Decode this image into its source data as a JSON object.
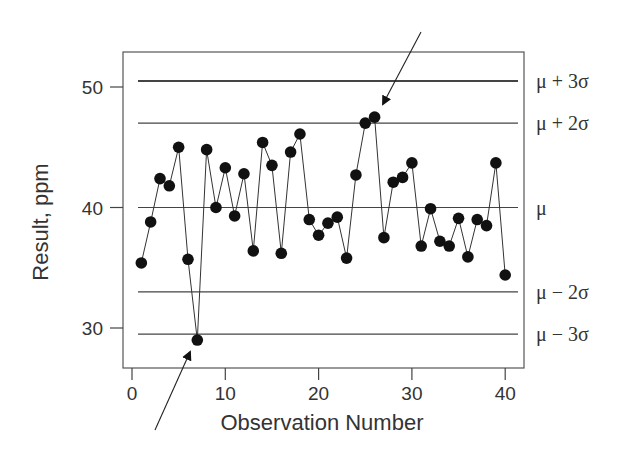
{
  "chart_data": {
    "type": "line",
    "title": "",
    "xlabel": "Observation Number",
    "ylabel": "Result, ppm",
    "xlim": [
      -1,
      42
    ],
    "ylim": [
      26.5,
      53
    ],
    "xticks": [
      0,
      10,
      20,
      30,
      40
    ],
    "yticks": [
      30,
      40,
      50
    ],
    "grid": false,
    "legend": null,
    "series": [
      {
        "name": "Result",
        "marker": "filled-circle",
        "x": [
          1,
          2,
          3,
          4,
          5,
          6,
          7,
          8,
          9,
          10,
          11,
          12,
          13,
          14,
          15,
          16,
          17,
          18,
          19,
          20,
          21,
          22,
          23,
          24,
          25,
          26,
          27,
          28,
          29,
          30,
          31,
          32,
          33,
          34,
          35,
          36,
          37,
          38,
          39,
          40
        ],
        "values": [
          35.4,
          38.8,
          42.4,
          41.8,
          45.0,
          35.7,
          29.0,
          44.8,
          40.0,
          43.3,
          39.3,
          42.8,
          36.4,
          45.4,
          43.5,
          36.2,
          44.6,
          46.1,
          39.0,
          37.7,
          38.7,
          39.2,
          35.8,
          42.7,
          47.0,
          47.5,
          37.5,
          42.1,
          42.5,
          43.7,
          36.8,
          39.9,
          37.2,
          36.8,
          39.1,
          35.9,
          39.0,
          38.5,
          43.7,
          34.4
        ]
      }
    ],
    "control_lines": [
      {
        "label": "μ + 3σ",
        "value": 50.5,
        "weight": "bold"
      },
      {
        "label": "μ + 2σ",
        "value": 47.0,
        "weight": "normal"
      },
      {
        "label": "μ",
        "value": 40.0,
        "weight": "normal"
      },
      {
        "label": "μ − 2σ",
        "value": 33.0,
        "weight": "normal"
      },
      {
        "label": "μ − 3σ",
        "value": 29.5,
        "weight": "normal"
      }
    ],
    "annotations": [
      {
        "type": "arrow",
        "target_x": 26,
        "target_y": 47.5,
        "note": "points near upper 2σ limit"
      },
      {
        "type": "arrow",
        "target_x": 7,
        "target_y": 29.0,
        "note": "point beyond lower 3σ limit"
      }
    ]
  }
}
